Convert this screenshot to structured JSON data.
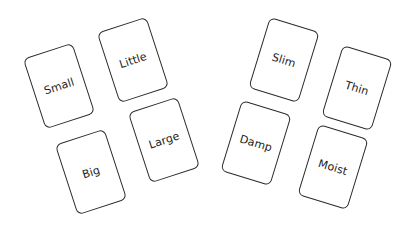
{
  "canvas": {
    "background": "#ffffff",
    "card_border_color": "#2a2a2a",
    "text_color": "#222222"
  },
  "groups": [
    {
      "name": "left-group",
      "cards": [
        {
          "label": "Small",
          "cx": 59,
          "cy": 86,
          "rotate": -18
        },
        {
          "label": "Little",
          "cx": 133,
          "cy": 60,
          "rotate": -18
        },
        {
          "label": "Big",
          "cx": 91,
          "cy": 172,
          "rotate": -18
        },
        {
          "label": "Large",
          "cx": 164,
          "cy": 140,
          "rotate": -18
        }
      ]
    },
    {
      "name": "right-group",
      "cards": [
        {
          "label": "Slim",
          "cx": 284,
          "cy": 60,
          "rotate": 17
        },
        {
          "label": "Thin",
          "cx": 357,
          "cy": 88,
          "rotate": 17
        },
        {
          "label": "Damp",
          "cx": 256,
          "cy": 143,
          "rotate": 17
        },
        {
          "label": "Moist",
          "cx": 333,
          "cy": 167,
          "rotate": 17
        }
      ]
    }
  ]
}
